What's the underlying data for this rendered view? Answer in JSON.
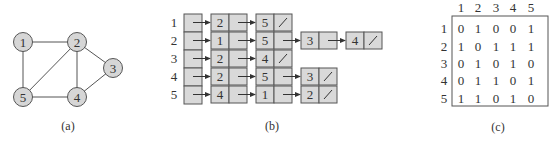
{
  "colors": {
    "node_fill": "#d6d6d6",
    "stroke": "#555555",
    "cell_fill": "#d9d9d9",
    "text": "#333333"
  },
  "graph": {
    "caption": "(a)",
    "nodes": [
      {
        "id": "1",
        "label": "1",
        "x": 23,
        "y": 42
      },
      {
        "id": "2",
        "label": "2",
        "x": 77,
        "y": 42
      },
      {
        "id": "3",
        "label": "3",
        "x": 113,
        "y": 68
      },
      {
        "id": "4",
        "label": "4",
        "x": 77,
        "y": 97
      },
      {
        "id": "5",
        "label": "5",
        "x": 23,
        "y": 97
      }
    ],
    "edges": [
      [
        "1",
        "2"
      ],
      [
        "1",
        "5"
      ],
      [
        "2",
        "5"
      ],
      [
        "2",
        "4"
      ],
      [
        "2",
        "3"
      ],
      [
        "3",
        "4"
      ],
      [
        "4",
        "5"
      ]
    ]
  },
  "adjacency_list": {
    "caption": "(b)",
    "rows": [
      {
        "label": "1",
        "list": [
          "2",
          "5"
        ]
      },
      {
        "label": "2",
        "list": [
          "1",
          "5",
          "3",
          "4"
        ]
      },
      {
        "label": "3",
        "list": [
          "2",
          "4"
        ]
      },
      {
        "label": "4",
        "list": [
          "2",
          "5",
          "3"
        ]
      },
      {
        "label": "5",
        "list": [
          "4",
          "1",
          "2"
        ]
      }
    ],
    "null_symbol": "/"
  },
  "adjacency_matrix": {
    "caption": "(c)",
    "col_headers": [
      "1",
      "2",
      "3",
      "4",
      "5"
    ],
    "row_headers": [
      "1",
      "2",
      "3",
      "4",
      "5"
    ],
    "rows": [
      [
        "0",
        "1",
        "0",
        "0",
        "1"
      ],
      [
        "1",
        "0",
        "1",
        "1",
        "1"
      ],
      [
        "0",
        "1",
        "0",
        "1",
        "0"
      ],
      [
        "0",
        "1",
        "1",
        "0",
        "1"
      ],
      [
        "1",
        "1",
        "0",
        "1",
        "0"
      ]
    ]
  }
}
